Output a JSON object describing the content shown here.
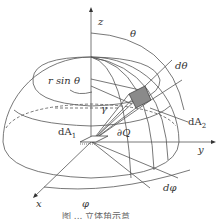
{
  "figure": {
    "type": "hemisphere solid-angle diagram",
    "labels": {
      "z": "z",
      "theta": "θ",
      "d_theta": "dθ",
      "r_sin_theta": "r sin θ",
      "gamma": "γ",
      "dA1": "dA",
      "dA1_sub": "1",
      "dA2": "dA",
      "dA2_sub": "2",
      "dQ": "∂Q",
      "y": "y",
      "x": "x",
      "phi": "φ",
      "d_phi": "dφ"
    },
    "caption": "图 ... 立体角示意",
    "colors": {
      "line": "#444444",
      "shade": "#8a8a8a",
      "background": "#ffffff"
    }
  }
}
